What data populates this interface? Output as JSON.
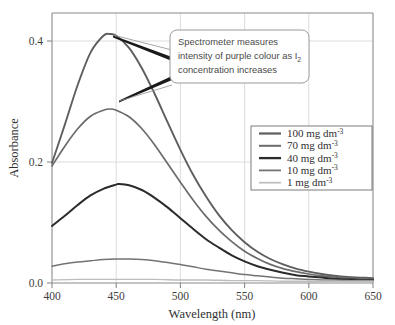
{
  "chart_data": {
    "type": "line",
    "title": "",
    "xlabel": "Wavelength (nm)",
    "ylabel": "Absorbance",
    "xlim": [
      400,
      650
    ],
    "ylim": [
      0.0,
      0.45
    ],
    "xticks": [
      "400",
      "450",
      "500",
      "550",
      "600",
      "650"
    ],
    "xtick_values": [
      400,
      450,
      500,
      550,
      600,
      650
    ],
    "yticks": [
      "0.0",
      "0.2",
      "0.4"
    ],
    "ytick_values": [
      0.0,
      0.2,
      0.4
    ],
    "grid": true,
    "legend_position": "center-right",
    "series": [
      {
        "name": "100 mg dm",
        "name_base": "100 mg dm",
        "name_sup": "-3",
        "color": "#5e5e5e",
        "width": 1.9,
        "peak_x": 445,
        "peak_y": 0.415,
        "x": [
          400,
          410,
          420,
          430,
          440,
          445,
          450,
          460,
          470,
          480,
          490,
          500,
          510,
          520,
          530,
          540,
          550,
          560,
          570,
          580,
          590,
          600,
          610,
          620,
          630,
          640,
          650
        ],
        "y": [
          0.2,
          0.264,
          0.33,
          0.384,
          0.412,
          0.415,
          0.412,
          0.392,
          0.358,
          0.315,
          0.268,
          0.222,
          0.18,
          0.144,
          0.113,
          0.088,
          0.068,
          0.052,
          0.04,
          0.031,
          0.024,
          0.019,
          0.015,
          0.012,
          0.01,
          0.009,
          0.008
        ]
      },
      {
        "name": "70 mg dm",
        "name_base": "70 mg dm",
        "name_sup": "-3",
        "color": "#6b6b6b",
        "width": 1.7,
        "peak_x": 445,
        "peak_y": 0.29,
        "x": [
          400,
          410,
          420,
          430,
          440,
          445,
          450,
          460,
          470,
          480,
          490,
          500,
          510,
          520,
          530,
          540,
          550,
          560,
          570,
          580,
          590,
          600,
          610,
          620,
          630,
          640,
          650
        ],
        "y": [
          0.195,
          0.228,
          0.257,
          0.278,
          0.288,
          0.29,
          0.288,
          0.277,
          0.257,
          0.23,
          0.199,
          0.168,
          0.138,
          0.111,
          0.088,
          0.069,
          0.053,
          0.041,
          0.031,
          0.024,
          0.019,
          0.015,
          0.012,
          0.01,
          0.008,
          0.007,
          0.006
        ]
      },
      {
        "name": "40 mg dm",
        "name_base": "40 mg dm",
        "name_sup": "-3",
        "color": "#2b2b2b",
        "width": 2.0,
        "peak_x": 452,
        "peak_y": 0.165,
        "x": [
          400,
          410,
          420,
          430,
          440,
          450,
          452,
          460,
          470,
          480,
          490,
          500,
          510,
          520,
          530,
          540,
          550,
          560,
          570,
          580,
          590,
          600,
          610,
          620,
          630,
          640,
          650
        ],
        "y": [
          0.095,
          0.112,
          0.13,
          0.146,
          0.157,
          0.164,
          0.165,
          0.163,
          0.155,
          0.142,
          0.126,
          0.108,
          0.09,
          0.073,
          0.059,
          0.046,
          0.036,
          0.028,
          0.022,
          0.017,
          0.013,
          0.011,
          0.009,
          0.007,
          0.006,
          0.005,
          0.005
        ]
      },
      {
        "name": "10 mg dm",
        "name_base": "10 mg dm",
        "name_sup": "-3",
        "color": "#737373",
        "width": 1.5,
        "peak_x": 455,
        "peak_y": 0.04,
        "x": [
          400,
          410,
          420,
          430,
          440,
          450,
          455,
          460,
          470,
          480,
          490,
          500,
          510,
          520,
          530,
          540,
          550,
          560,
          570,
          580,
          590,
          600,
          610,
          620,
          630,
          640,
          650
        ],
        "y": [
          0.028,
          0.032,
          0.035,
          0.037,
          0.039,
          0.04,
          0.04,
          0.04,
          0.039,
          0.037,
          0.034,
          0.031,
          0.027,
          0.023,
          0.02,
          0.017,
          0.014,
          0.012,
          0.01,
          0.008,
          0.007,
          0.006,
          0.005,
          0.005,
          0.004,
          0.004,
          0.004
        ]
      },
      {
        "name": "1 mg dm",
        "name_base": "1 mg dm",
        "name_sup": "-3",
        "color": "#bdbdbd",
        "width": 1.4,
        "peak_x": 450,
        "peak_y": 0.006,
        "x": [
          400,
          420,
          440,
          450,
          460,
          480,
          500,
          520,
          540,
          560,
          580,
          600,
          620,
          650
        ],
        "y": [
          0.005,
          0.006,
          0.006,
          0.006,
          0.006,
          0.006,
          0.005,
          0.005,
          0.004,
          0.004,
          0.003,
          0.003,
          0.003,
          0.003
        ]
      }
    ],
    "annotations": [
      {
        "id": "spectrometer-callout",
        "line1": "Spectrometer measures",
        "line2_a": "intensity of purple colour as I",
        "line2_sub": "2",
        "line3": "concentration increases",
        "points_to": [
          "100 mg dm-3 peak",
          "70 mg dm-3 peak"
        ]
      }
    ]
  },
  "legend": {
    "entries": [
      {
        "label_base": "100 mg dm",
        "label_sup": "-3"
      },
      {
        "label_base": "70 mg dm",
        "label_sup": "-3"
      },
      {
        "label_base": "40 mg dm",
        "label_sup": "-3"
      },
      {
        "label_base": "10 mg dm",
        "label_sup": "-3"
      },
      {
        "label_base": "1 mg dm",
        "label_sup": "-3"
      }
    ]
  },
  "axes": {
    "x_title": "Wavelength (nm)",
    "y_title": "Absorbance",
    "x_tick_labels": [
      "400",
      "450",
      "500",
      "550",
      "600",
      "650"
    ],
    "y_tick_labels": [
      "0.0",
      "0.2",
      "0.4"
    ]
  },
  "callout": {
    "line1": "Spectrometer measures",
    "line2_a": "intensity of purple colour as I",
    "line2_sub": "2",
    "line3": "concentration increases"
  }
}
